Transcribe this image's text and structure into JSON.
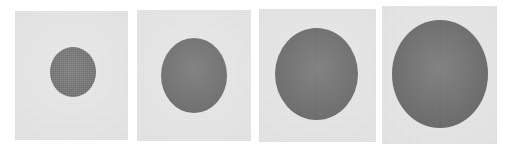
{
  "figure": {
    "name": "circle-size-progression",
    "background_color": "#ffffff",
    "panel_count": 4,
    "panel_background_color": "#e2e2e2",
    "blob_color": "#4b4b4b",
    "panels": [
      {
        "index": 1,
        "label": "panel-1",
        "x": 15,
        "y": 11,
        "width": 113,
        "height": 129,
        "blob": {
          "label": "circle-1",
          "center_x": 73,
          "center_y": 72,
          "width": 46,
          "height": 50,
          "seam": false
        }
      },
      {
        "index": 2,
        "label": "panel-2",
        "x": 137,
        "y": 10,
        "width": 114,
        "height": 131,
        "blob": {
          "label": "circle-2",
          "center_x": 194,
          "center_y": 75,
          "width": 66,
          "height": 75,
          "seam": false
        }
      },
      {
        "index": 3,
        "label": "panel-3",
        "x": 259,
        "y": 9,
        "width": 117,
        "height": 133,
        "blob": {
          "label": "circle-3",
          "center_x": 316,
          "center_y": 74,
          "width": 83,
          "height": 92,
          "seam": true
        }
      },
      {
        "index": 4,
        "label": "panel-4",
        "x": 382,
        "y": 6,
        "width": 115,
        "height": 138,
        "blob": {
          "label": "circle-4",
          "center_x": 440,
          "center_y": 74,
          "width": 96,
          "height": 108,
          "seam": true
        }
      }
    ]
  }
}
